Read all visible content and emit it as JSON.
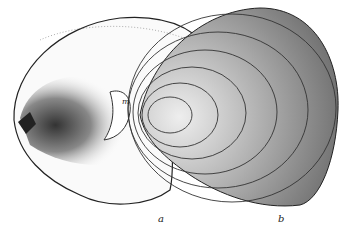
{
  "figure": {
    "labels": {
      "a": "a",
      "b": "b",
      "m": "m"
    },
    "colors": {
      "ink": "#222222",
      "paper": "#ffffff",
      "shade": "#555555"
    }
  }
}
